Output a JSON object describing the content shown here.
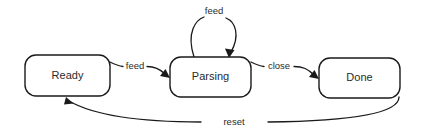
{
  "diagram": {
    "type": "state-machine",
    "background_color": "#ffffff",
    "stroke_color": "#1a1a1a",
    "text_color": "#2b2b2b",
    "states": [
      {
        "id": "ready",
        "label": "Ready"
      },
      {
        "id": "parsing",
        "label": "Parsing"
      },
      {
        "id": "done",
        "label": "Done"
      }
    ],
    "transitions": [
      {
        "id": "ready-to-parsing",
        "label": "feed",
        "from": "Ready",
        "to": "Parsing"
      },
      {
        "id": "parsing-self-loop",
        "label": "feed",
        "from": "Parsing",
        "to": "Parsing"
      },
      {
        "id": "parsing-to-done",
        "label": "close",
        "from": "Parsing",
        "to": "Done"
      },
      {
        "id": "done-to-ready",
        "label": "reset",
        "from": "Done",
        "to": "Ready"
      }
    ]
  }
}
